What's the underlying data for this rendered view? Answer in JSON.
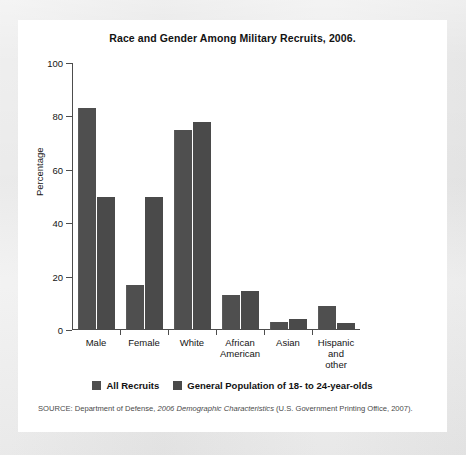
{
  "figure": {
    "title": "Race and Gender Among Military Recruits, 2006.",
    "y_axis_title": "Percentage",
    "source_parts": {
      "prefix": "SOURCE: Department of Defense, ",
      "italic": "2006 Demographic Characteristics",
      "suffix": " (U.S. Government Printing Office, 2007)."
    }
  },
  "colors": {
    "page_background": "#e9e9e9",
    "card_background": "#ffffff",
    "bar_all_recruits": "#4f4f4f",
    "bar_general_population": "#4a4a4a",
    "axis": "#4d4d4d",
    "text": "#121212"
  },
  "chart_data": {
    "type": "bar",
    "title": "Race and Gender Among Military Recruits, 2006.",
    "xlabel": "",
    "ylabel": "Percentage",
    "ylim": [
      0,
      100
    ],
    "yticks": [
      0,
      20,
      40,
      60,
      80,
      100
    ],
    "ytick_labels": [
      "0",
      "20",
      "40",
      "60",
      "80",
      "100"
    ],
    "grid": false,
    "legend_position": "bottom-center",
    "categories": [
      "Male",
      "Female",
      "White",
      "African\nAmerican",
      "Asian",
      "Hispanic\nand other"
    ],
    "series": [
      {
        "name": "All Recruits",
        "values": [
          83,
          17,
          75,
          13,
          3,
          9
        ]
      },
      {
        "name": "General Population of 18- to 24-year-olds",
        "values": [
          50,
          50,
          78,
          14.5,
          4,
          2.5
        ]
      }
    ]
  }
}
